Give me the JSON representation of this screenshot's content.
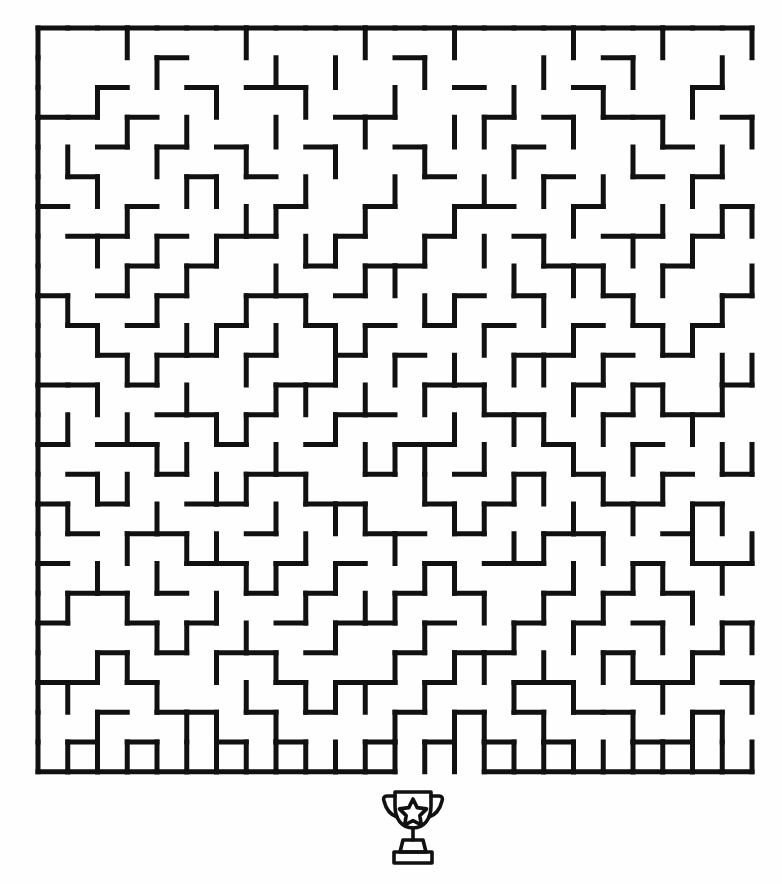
{
  "page": {
    "background_color": "#fefefe",
    "width": 782,
    "height": 884
  },
  "maze": {
    "name": "rectangular-perfect-maze",
    "cols": 24,
    "rows": 25,
    "cell_size": 29.75,
    "origin_x": 38,
    "origin_y": 28,
    "wall_color": "#111111",
    "wall_thickness": 5,
    "entrance": {
      "side": "bottom",
      "col": 12,
      "label": "exit-gap-bottom"
    },
    "goal": {
      "icon": "trophy-icon",
      "label": "Finish"
    },
    "h_walls": [
      "111111111111111111111111",
      "000010000000100000010000",
      "001001011000001000100010",
      "110100000011000101011001",
      "001010100100100010000100",
      "010001010000010001001010",
      "100100001001001100100001",
      "011010110010010010011010",
      "000101000101100001100100",
      "101010011010001010010001",
      "010100100101010100101010",
      "001011010010100011010100",
      "110100001100011000101001",
      "000011010011000110010110",
      "101100100100110001001000",
      "010010011001001010100101",
      "101001100110010100011010",
      "010110010001101001100100",
      "100001101010010110001011",
      "011010010100101001010100",
      "100101001011010010101001",
      "001010110100101100010010",
      "110100001011010011001101",
      "001011010100101010110010",
      "010100101001010101001100",
      "111111111111000111111111"
    ],
    "v_walls": [
      "1001000100010010001001001",
      "1000100010100100010010010",
      "1010001001001000100100100",
      "1001010010010011001001001",
      "1100100100100100100010010",
      "1010011001001001010100100",
      "1001000110010010001001011",
      "1010101001100101010010100",
      "1001010010011000101101001",
      "1100100101000110010010010",
      "1010011010110001001001100",
      "1001100100101010110100011",
      "1010010011010101001011010",
      "1101001100100010110100100",
      "1000110010011101001010011",
      "1011001101000100110101000",
      "1100100010110011001010110",
      "1001011001001000110100101",
      "1010100110100110001011010",
      "1101001001011001010100100",
      "1000110100100100101001011",
      "1011001010001011010110100",
      "1100100101110100101001001",
      "1010011010001011010010110",
      "1111111111111111111111111"
    ]
  },
  "trophy": {
    "name": "trophy-icon",
    "label": "Finish trophy",
    "color": "#111111",
    "star_label": "star"
  }
}
